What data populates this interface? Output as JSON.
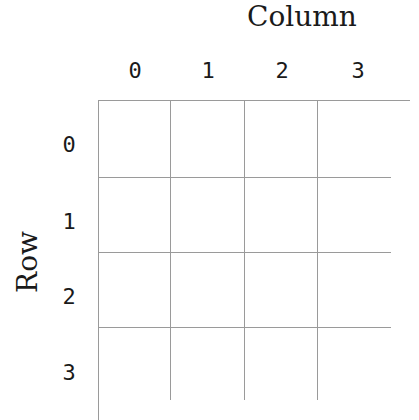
{
  "diagram": {
    "column_axis_title": "Column",
    "row_axis_title": "Row",
    "column_labels": [
      "0",
      "1",
      "2",
      "3"
    ],
    "row_labels": [
      "0",
      "1",
      "2",
      "3"
    ],
    "grid": {
      "rows": 4,
      "columns": 4,
      "cells": [
        [
          "",
          "",
          "",
          ""
        ],
        [
          "",
          "",
          "",
          ""
        ],
        [
          "",
          "",
          "",
          ""
        ],
        [
          "",
          "",
          "",
          ""
        ]
      ],
      "line_color": "#9a9a9a"
    }
  }
}
